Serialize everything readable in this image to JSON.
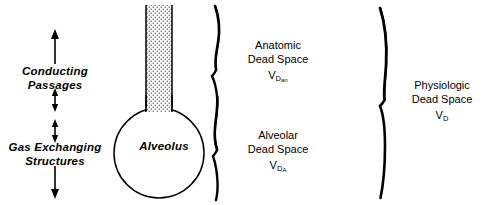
{
  "figure": {
    "ink_color": "#000000",
    "background_color": "#ffffff"
  },
  "left_column": {
    "conducting_label_line1": "Conducting",
    "conducting_label_line2": "Passages",
    "gas_exchanging_label_line1": "Gas Exchanging",
    "gas_exchanging_label_line2": "Structures",
    "arrows": [
      {
        "name": "up-arrow-top",
        "direction": "up"
      },
      {
        "name": "double-arrow-upper",
        "direction": "both"
      },
      {
        "name": "double-arrow-lower",
        "direction": "both"
      },
      {
        "name": "down-arrow-bottom",
        "direction": "down"
      }
    ]
  },
  "alveolus": {
    "label": "Alveolus",
    "airway_fill": "stipple-dots"
  },
  "braces": {
    "inner_brace_name": "wavy-brace-inner",
    "outer_brace_name": "wavy-brace-outer"
  },
  "compartments": [
    {
      "name": "anatomic-dead-space",
      "line1": "Anatomic",
      "line2": "Dead Space",
      "symbol_base": "V",
      "symbol_sub": "D",
      "symbol_subsub": "an"
    },
    {
      "name": "alveolar-dead-space",
      "line1": "Alveolar",
      "line2": "Dead Space",
      "symbol_base": "V",
      "symbol_sub": "D",
      "symbol_subsub": "A"
    },
    {
      "name": "physiologic-dead-space",
      "line1": "Physiologic",
      "line2": "Dead Space",
      "symbol_base": "V",
      "symbol_sub": "D",
      "symbol_subsub": ""
    }
  ]
}
